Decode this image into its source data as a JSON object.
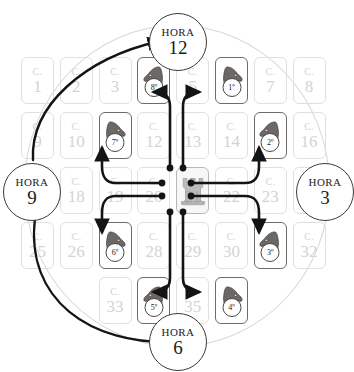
{
  "diagram": {
    "cell_prefix": "C.",
    "grid": {
      "rows": 5,
      "cols": 8,
      "cells": [
        {
          "n": "1",
          "r": 0,
          "c": 0,
          "state": "faded"
        },
        {
          "n": "2",
          "r": 0,
          "c": 1,
          "state": "faded"
        },
        {
          "n": "3",
          "r": 0,
          "c": 2,
          "state": "faded"
        },
        {
          "n": "4",
          "r": 0,
          "c": 3,
          "state": "knight",
          "knight": "8º",
          "facing": "left"
        },
        {
          "n": "5",
          "r": 0,
          "c": 4,
          "state": "faded"
        },
        {
          "n": "6",
          "r": 0,
          "c": 5,
          "state": "knight",
          "knight": "1º",
          "facing": "right"
        },
        {
          "n": "7",
          "r": 0,
          "c": 6,
          "state": "faded"
        },
        {
          "n": "8",
          "r": 0,
          "c": 7,
          "state": "faded"
        },
        {
          "n": "9",
          "r": 1,
          "c": 0,
          "state": "faded"
        },
        {
          "n": "10",
          "r": 1,
          "c": 1,
          "state": "faded"
        },
        {
          "n": "11",
          "r": 1,
          "c": 2,
          "state": "knight",
          "knight": "7º",
          "facing": "right"
        },
        {
          "n": "12",
          "r": 1,
          "c": 3,
          "state": "faded"
        },
        {
          "n": "13",
          "r": 1,
          "c": 4,
          "state": "faded"
        },
        {
          "n": "14",
          "r": 1,
          "c": 5,
          "state": "faded"
        },
        {
          "n": "15",
          "r": 1,
          "c": 6,
          "state": "knight",
          "knight": "2º",
          "facing": "left"
        },
        {
          "n": "16",
          "r": 1,
          "c": 7,
          "state": "faded"
        },
        {
          "n": "17",
          "r": 2,
          "c": 0,
          "state": "faded"
        },
        {
          "n": "18",
          "r": 2,
          "c": 1,
          "state": "faded"
        },
        {
          "n": "19",
          "r": 2,
          "c": 2,
          "state": "faded"
        },
        {
          "n": "20",
          "r": 2,
          "c": 3,
          "state": "faded"
        },
        {
          "n": "21",
          "r": 2,
          "c": 4,
          "state": "center"
        },
        {
          "n": "22",
          "r": 2,
          "c": 5,
          "state": "faded"
        },
        {
          "n": "23",
          "r": 2,
          "c": 6,
          "state": "faded"
        },
        {
          "n": "24",
          "r": 2,
          "c": 7,
          "state": "faded"
        },
        {
          "n": "25",
          "r": 3,
          "c": 0,
          "state": "faded"
        },
        {
          "n": "26",
          "r": 3,
          "c": 1,
          "state": "faded"
        },
        {
          "n": "27",
          "r": 3,
          "c": 2,
          "state": "knight",
          "knight": "6º",
          "facing": "right"
        },
        {
          "n": "28",
          "r": 3,
          "c": 3,
          "state": "faded"
        },
        {
          "n": "29",
          "r": 3,
          "c": 4,
          "state": "faded"
        },
        {
          "n": "30",
          "r": 3,
          "c": 5,
          "state": "faded"
        },
        {
          "n": "31",
          "r": 3,
          "c": 6,
          "state": "knight",
          "knight": "3º",
          "facing": "left"
        },
        {
          "n": "32",
          "r": 3,
          "c": 7,
          "state": "faded"
        },
        {
          "n": "33",
          "r": 4,
          "c": 2,
          "state": "faded"
        },
        {
          "n": "34",
          "r": 4,
          "c": 3,
          "state": "knight",
          "knight": "5º",
          "facing": "left"
        },
        {
          "n": "35",
          "r": 4,
          "c": 4,
          "state": "faded"
        },
        {
          "n": "36",
          "r": 4,
          "c": 5,
          "state": "knight",
          "knight": "4º",
          "facing": "right"
        }
      ]
    },
    "hours": [
      {
        "id": "hora-12",
        "label": "HORA",
        "value": "12",
        "pos": "top"
      },
      {
        "id": "hora-3",
        "label": "HORA",
        "value": "3",
        "pos": "right"
      },
      {
        "id": "hora-6",
        "label": "HORA",
        "value": "6",
        "pos": "bottom"
      },
      {
        "id": "hora-9",
        "label": "HORA",
        "value": "9",
        "pos": "left"
      }
    ],
    "center_piece": "rook-icon",
    "moves": [
      {
        "order": "1º",
        "target_cell": "6",
        "direction": "up-right"
      },
      {
        "order": "2º",
        "target_cell": "15",
        "direction": "right-up"
      },
      {
        "order": "3º",
        "target_cell": "31",
        "direction": "right-down"
      },
      {
        "order": "4º",
        "target_cell": "36",
        "direction": "down-right"
      },
      {
        "order": "5º",
        "target_cell": "34",
        "direction": "down-left"
      },
      {
        "order": "6º",
        "target_cell": "27",
        "direction": "left-down"
      },
      {
        "order": "7º",
        "target_cell": "11",
        "direction": "left-up"
      },
      {
        "order": "8º",
        "target_cell": "4",
        "direction": "up-left"
      }
    ],
    "colors": {
      "arrow": "#141414",
      "faded_text": "#d5d3d1",
      "active_border": "#6e6c6a",
      "knight_fill": "#6b6866",
      "outer_circle": "#d8d6d4",
      "hour_ring": "#3d3b39"
    }
  }
}
